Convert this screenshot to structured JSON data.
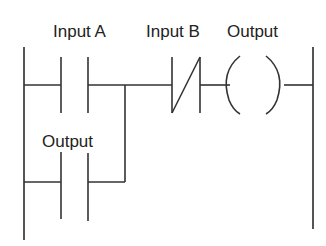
{
  "diagram": {
    "type": "ladder-logic",
    "colors": {
      "line": "#333333",
      "text": "#222222",
      "background": "#ffffff"
    },
    "labels": {
      "input_a": "Input A",
      "input_b": "Input B",
      "output_coil": "Output",
      "output_contact": "Output"
    },
    "elements": [
      {
        "id": "input_a",
        "kind": "normally-open contact",
        "label": "Input A",
        "rung": 1
      },
      {
        "id": "input_b",
        "kind": "normally-closed contact",
        "label": "Input B",
        "rung": 1
      },
      {
        "id": "output_coil",
        "kind": "coil",
        "label": "Output",
        "rung": 1
      },
      {
        "id": "output_contact",
        "kind": "normally-open contact (seal-in branch)",
        "label": "Output",
        "parallel_to": "input_a"
      }
    ]
  }
}
